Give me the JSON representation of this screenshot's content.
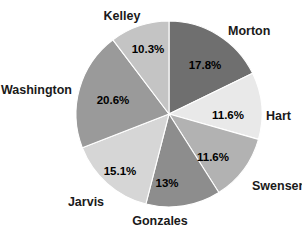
{
  "chart_data": {
    "type": "pie",
    "title": "",
    "subtitle": "",
    "xlabel": "",
    "ylabel": "",
    "legend_position": "none",
    "grid": false,
    "start_angle_deg": 0,
    "direction": "clockwise",
    "center": {
      "x": 169,
      "y": 114
    },
    "radius": 93,
    "categories": [
      "Morton",
      "Hart",
      "Swensen",
      "Gonzales",
      "Jarvis",
      "Washington",
      "Kelley"
    ],
    "values": [
      17.8,
      11.6,
      11.6,
      13.0,
      15.1,
      20.6,
      10.3
    ],
    "value_labels": [
      "17.8%",
      "11.6%",
      "11.6%",
      "13%",
      "15.1%",
      "20.6%",
      "10.3%"
    ],
    "slice_colors": [
      "#6f6f6f",
      "#e9e9e9",
      "#b2b2b2",
      "#8d8d8d",
      "#d6d6d6",
      "#9a9a9a",
      "#c4c4c4"
    ],
    "slices": [
      {
        "name": "Morton",
        "value": 17.8,
        "value_label": "17.8%",
        "color": "#6f6f6f",
        "pct_label_pos": {
          "x": 205,
          "y": 66
        },
        "cat_label_pos": {
          "x": 228,
          "y": 32
        },
        "cat_label_anchor": "start"
      },
      {
        "name": "Hart",
        "value": 11.6,
        "value_label": "11.6%",
        "color": "#e9e9e9",
        "pct_label_pos": {
          "x": 228,
          "y": 116
        },
        "cat_label_pos": {
          "x": 266,
          "y": 117
        },
        "cat_label_anchor": "start"
      },
      {
        "name": "Swensen",
        "value": 11.6,
        "value_label": "11.6%",
        "color": "#b2b2b2",
        "pct_label_pos": {
          "x": 213,
          "y": 158
        },
        "cat_label_pos": {
          "x": 252,
          "y": 187
        },
        "cat_label_anchor": "start"
      },
      {
        "name": "Gonzales",
        "value": 13.0,
        "value_label": "13%",
        "color": "#8d8d8d",
        "pct_label_pos": {
          "x": 167,
          "y": 184
        },
        "cat_label_pos": {
          "x": 160,
          "y": 222
        },
        "cat_label_anchor": "middle"
      },
      {
        "name": "Jarvis",
        "value": 15.1,
        "value_label": "15.1%",
        "color": "#d6d6d6",
        "pct_label_pos": {
          "x": 120,
          "y": 172
        },
        "cat_label_pos": {
          "x": 86,
          "y": 203
        },
        "cat_label_anchor": "middle"
      },
      {
        "name": "Washington",
        "value": 20.6,
        "value_label": "20.6%",
        "color": "#9a9a9a",
        "pct_label_pos": {
          "x": 113,
          "y": 101
        },
        "cat_label_pos": {
          "x": 72,
          "y": 91
        },
        "cat_label_anchor": "end"
      },
      {
        "name": "Kelley",
        "value": 10.3,
        "value_label": "10.3%",
        "color": "#c4c4c4",
        "pct_label_pos": {
          "x": 148,
          "y": 50
        },
        "cat_label_pos": {
          "x": 122,
          "y": 17
        },
        "cat_label_anchor": "middle"
      }
    ]
  }
}
